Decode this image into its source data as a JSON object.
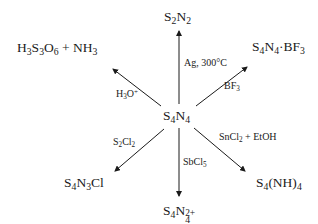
{
  "center": {
    "formula": "S4N4",
    "parts": [
      "S",
      "4",
      "N",
      "4"
    ]
  },
  "products": {
    "top": {
      "formula": "S2N2",
      "parts": [
        "S",
        "2",
        "N",
        "2"
      ]
    },
    "top_right": {
      "formula": "S4N4·BF3",
      "parts": [
        "S",
        "4",
        "N",
        "4",
        "·BF",
        "3"
      ]
    },
    "top_left": {
      "formula": "H3S3O6 + NH3",
      "parts": [
        "H",
        "3",
        "S",
        "3",
        "O",
        "6",
        " + NH",
        "3"
      ]
    },
    "bottom_left": {
      "formula": "S4N3Cl",
      "parts": [
        "S",
        "4",
        "N",
        "3",
        "Cl"
      ]
    },
    "bottom": {
      "formula": "S4N4 2+",
      "parts": [
        "S",
        "4",
        "N",
        "4",
        "2+"
      ]
    },
    "bottom_right": {
      "formula": "S4(NH)4",
      "parts": [
        "S",
        "4",
        "(NH)",
        "4"
      ]
    }
  },
  "reagents": {
    "top": {
      "text": "Ag, 300°C"
    },
    "top_right": {
      "parts": [
        "BF",
        "3"
      ]
    },
    "top_left": {
      "parts": [
        "H",
        "3",
        "O",
        "+"
      ]
    },
    "bottom_left": {
      "parts": [
        "S",
        "2",
        "Cl",
        "2"
      ]
    },
    "bottom": {
      "parts": [
        "SbCl",
        "5"
      ]
    },
    "bottom_right": {
      "parts": [
        "SnCl",
        "2",
        " + EtOH"
      ]
    }
  },
  "colors": {
    "ink": "#1a1a1a",
    "background": "#ffffff"
  }
}
